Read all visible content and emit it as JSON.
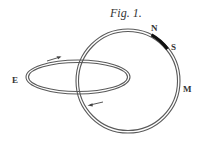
{
  "figure": {
    "title": "Fig. 1.",
    "labels": {
      "north": "N",
      "south": "S",
      "magnet": "M",
      "east": "E"
    },
    "colors": {
      "line": "#555555",
      "magnet_segment": "#111111",
      "text": "#333333",
      "background": "#ffffff"
    },
    "shapes": {
      "circle": {
        "cx": 128,
        "cy": 81,
        "r": 51
      },
      "ellipse": {
        "cx": 78,
        "cy": 77,
        "rx": 51,
        "ry": 16
      }
    },
    "arrows": [
      {
        "position": "upper-left of ellipse",
        "direction": "right"
      },
      {
        "position": "below ellipse crossing",
        "direction": "left"
      }
    ]
  }
}
